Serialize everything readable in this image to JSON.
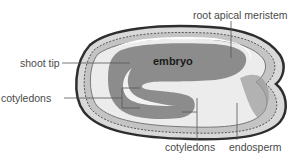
{
  "diagram": {
    "labels": {
      "root_apical_meristem": "root apical meristem",
      "embryo": "embryo",
      "shoot_tip": "shoot tip",
      "cotyledons_left": "cotyledons",
      "cotyledons_bottom": "cotyledons",
      "endosperm": "endosperm"
    },
    "colors": {
      "embryo": "#8c8c8c",
      "endosperm": "#e6e6e6",
      "seed_coat": "#3a3a3a",
      "label_text": "#4a4a4a",
      "leader_line": "#555555"
    }
  }
}
